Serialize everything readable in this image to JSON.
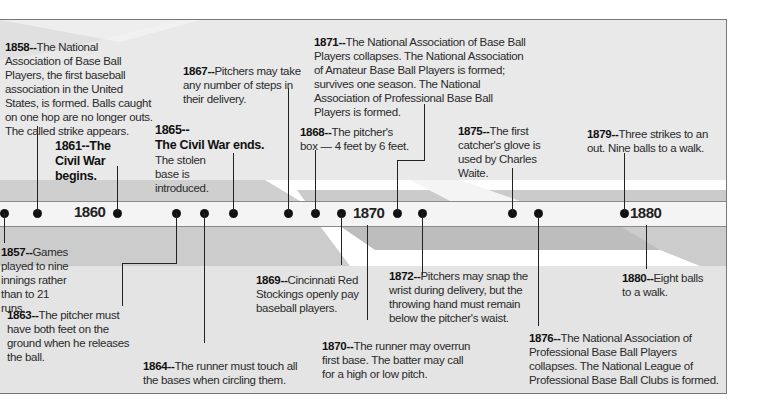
{
  "timeline": {
    "decades": [
      {
        "label": "1860",
        "x": 74
      },
      {
        "label": "1870",
        "x": 353
      },
      {
        "label": "1880",
        "x": 630
      }
    ],
    "dot_positions": [
      4,
      37,
      117,
      176,
      204,
      233,
      288,
      315,
      341,
      397,
      422,
      512,
      538,
      624
    ]
  },
  "events": {
    "e1857": {
      "year": "1857--",
      "text": "Games played to nine innings rather than to 21 runs."
    },
    "e1858": {
      "year": "1858--",
      "text": "The National Association of Base Ball Players, the first baseball association in the United States, is formed. Balls caught on one hop are no longer outs. The called strike appears."
    },
    "e1861": {
      "year": "1861--The",
      "text": "Civil War begins."
    },
    "e1863": {
      "year": "1863--",
      "text": "The pitcher must have both feet on the ground when he releases the ball."
    },
    "e1864": {
      "year": "1864--",
      "text": "The runner must touch all the bases when circling them."
    },
    "e1865": {
      "year": "1865--",
      "headline": "The Civil War ends.",
      "text": "The stolen base is introduced."
    },
    "e1867": {
      "year": "1867--",
      "text": "Pitchers may take any number of steps in their delivery."
    },
    "e1868": {
      "year": "1868--",
      "text": "The pitcher's box — 4 feet by 6 feet."
    },
    "e1869": {
      "year": "1869--",
      "text": "Cincinnati Red Stockings openly pay baseball players."
    },
    "e1870": {
      "year": "1870--",
      "text": "The runner may overrun first base. The batter may call for a high or low pitch."
    },
    "e1871": {
      "year": "1871--",
      "text": "The National Association of Base Ball Players collapses. The National Association of Amateur Base Ball Players is formed; survives one season. The National Association of Professional Base Ball Players is formed."
    },
    "e1872": {
      "year": "1872--",
      "text": "Pitchers may snap the wrist during delivery, but the throwing hand must remain below the pitcher's waist."
    },
    "e1875": {
      "year": "1875--",
      "text": "The first catcher's glove is used by Charles Waite."
    },
    "e1876": {
      "year": "1876--",
      "text": "The National Association of Professional Base Ball Players collapses. The National League of Professional Base Ball Clubs is formed."
    },
    "e1879": {
      "year": "1879--",
      "text": "Three strikes to an out. Nine balls to a walk."
    },
    "e1880": {
      "year": "1880--",
      "text": "Eight balls to a walk."
    }
  }
}
